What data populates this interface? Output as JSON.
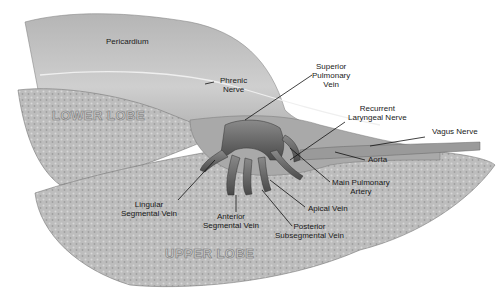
{
  "figure": {
    "type": "anatomical-illustration",
    "colors": {
      "tissue_light": "#c9c9c9",
      "tissue_mid": "#a8a8a8",
      "tissue_dark": "#6e6e6e",
      "vein": "#555555",
      "label_text": "#1a1a1a",
      "leader_line": "#111111"
    }
  },
  "regions": {
    "lower_lobe": "LOWER LOBE",
    "upper_lobe": "UPPER LOBE"
  },
  "labels": {
    "pericardium": "Pericardium",
    "phrenic_nerve": [
      "Phrenic",
      "Nerve"
    ],
    "superior_pulmonary_vein": [
      "Superior",
      "Pulmonary",
      "Vein"
    ],
    "recurrent_laryngeal_nerve": [
      "Recurrent",
      "Laryngeal Nerve"
    ],
    "vagus_nerve": "Vagus Nerve",
    "aorta": "Aorta",
    "main_pulmonary_artery": [
      "Main Pulmonary",
      "Artery"
    ],
    "apical_vein": "Apical Vein",
    "posterior_subsegmental_vein": [
      "Posterior",
      "Subsegmental Vein"
    ],
    "anterior_segmental_vein": [
      "Anterior",
      "Segmental Vein"
    ],
    "lingular_segmental_vein": [
      "Lingular",
      "Segmental Vein"
    ]
  }
}
